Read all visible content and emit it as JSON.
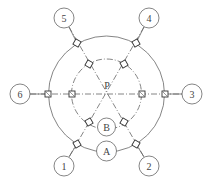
{
  "diagram": {
    "center_label": "P",
    "center": [
      106.5,
      94
    ],
    "outer_radius": 58,
    "inner_radius": 35,
    "line_color": "#555555",
    "bubbles": [
      {
        "id": "1",
        "label": "1",
        "cx": 64,
        "cy": 166
      },
      {
        "id": "2",
        "label": "2",
        "cx": 149,
        "cy": 166
      },
      {
        "id": "3",
        "label": "3",
        "cx": 192,
        "cy": 94
      },
      {
        "id": "4",
        "label": "4",
        "cx": 149,
        "cy": 18
      },
      {
        "id": "5",
        "label": "5",
        "cx": 64,
        "cy": 18
      },
      {
        "id": "6",
        "label": "6",
        "cx": 20,
        "cy": 94
      }
    ],
    "ring_labels": [
      {
        "id": "A",
        "label": "A",
        "cx": 106.5,
        "cy": 151
      },
      {
        "id": "B",
        "label": "B",
        "cx": 106.5,
        "cy": 127
      }
    ]
  }
}
